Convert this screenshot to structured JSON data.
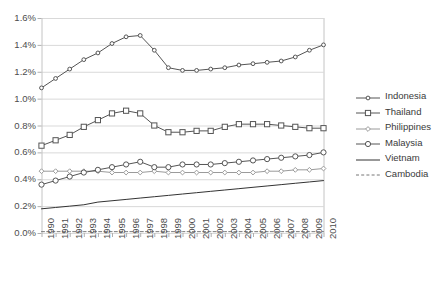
{
  "chart_data": {
    "type": "line",
    "title": "",
    "xlabel": "",
    "ylabel": "",
    "grid": true,
    "legend_position": "right",
    "ylim": [
      0.0,
      1.6
    ],
    "ytick_labels": [
      "0.0%",
      "0.2%",
      "0.4%",
      "0.6%",
      "0.8%",
      "1.0%",
      "1.2%",
      "1.4%",
      "1.6%"
    ],
    "ytick_values": [
      0.0,
      0.2,
      0.4,
      0.6,
      0.8,
      1.0,
      1.2,
      1.4,
      1.6
    ],
    "categories": [
      "1990",
      "1991",
      "1992",
      "1993",
      "1994",
      "1995",
      "1996",
      "1997",
      "1998",
      "1999",
      "2000",
      "2001",
      "2002",
      "2003",
      "2004",
      "2005",
      "2006",
      "2007",
      "2008",
      "2009",
      "2010"
    ],
    "x": [
      1990,
      1991,
      1992,
      1993,
      1994,
      1995,
      1996,
      1997,
      1998,
      1999,
      2000,
      2001,
      2002,
      2003,
      2004,
      2005,
      2006,
      2007,
      2008,
      2009,
      2010
    ],
    "series": [
      {
        "name": "Indonesia",
        "marker": "circle-small",
        "line_style": "solid",
        "color": "#555555",
        "values": [
          1.08,
          1.15,
          1.22,
          1.29,
          1.34,
          1.41,
          1.46,
          1.47,
          1.36,
          1.23,
          1.21,
          1.21,
          1.22,
          1.23,
          1.25,
          1.26,
          1.27,
          1.28,
          1.31,
          1.36,
          1.4
        ]
      },
      {
        "name": "Thailand",
        "marker": "square",
        "line_style": "solid",
        "color": "#555555",
        "values": [
          0.65,
          0.69,
          0.73,
          0.79,
          0.84,
          0.89,
          0.91,
          0.89,
          0.8,
          0.75,
          0.75,
          0.76,
          0.76,
          0.79,
          0.81,
          0.81,
          0.81,
          0.8,
          0.79,
          0.78,
          0.78
        ]
      },
      {
        "name": "Philippines",
        "marker": "diamond-small",
        "line_style": "solid",
        "color": "#9a9a9a",
        "values": [
          0.46,
          0.46,
          0.46,
          0.46,
          0.46,
          0.45,
          0.45,
          0.45,
          0.46,
          0.45,
          0.45,
          0.45,
          0.45,
          0.45,
          0.45,
          0.45,
          0.46,
          0.46,
          0.47,
          0.47,
          0.48
        ]
      },
      {
        "name": "Malaysia",
        "marker": "circle",
        "line_style": "solid",
        "color": "#555555",
        "values": [
          0.36,
          0.39,
          0.42,
          0.45,
          0.47,
          0.49,
          0.51,
          0.53,
          0.49,
          0.49,
          0.51,
          0.51,
          0.51,
          0.52,
          0.53,
          0.54,
          0.55,
          0.56,
          0.57,
          0.58,
          0.6
        ]
      },
      {
        "name": "Vietnam",
        "marker": "none",
        "line_style": "solid",
        "color": "#333333",
        "values": [
          0.18,
          0.19,
          0.2,
          0.21,
          0.23,
          0.24,
          0.25,
          0.26,
          0.27,
          0.28,
          0.29,
          0.3,
          0.31,
          0.32,
          0.33,
          0.34,
          0.35,
          0.36,
          0.37,
          0.38,
          0.39
        ]
      },
      {
        "name": "Cambodia",
        "marker": "none",
        "line_style": "dotted",
        "color": "#777777",
        "values": [
          0.01,
          0.01,
          0.01,
          0.01,
          0.01,
          0.01,
          0.01,
          0.01,
          0.01,
          0.01,
          0.01,
          0.01,
          0.01,
          0.01,
          0.01,
          0.01,
          0.01,
          0.01,
          0.01,
          0.01,
          0.01
        ]
      }
    ]
  }
}
